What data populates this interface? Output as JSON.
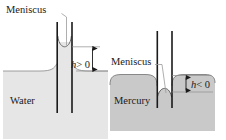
{
  "figure": {
    "width": 226,
    "height": 140,
    "background": "#ffffff"
  },
  "panels": {
    "left": {
      "name": "water-panel",
      "liquid_label": "Water",
      "meniscus_label": "Meniscus",
      "height_label": "h > 0",
      "height_label_symbol": "h",
      "height_label_operator": "> 0",
      "meniscus_shape": "concave",
      "liquid_color": "#e6e6e6",
      "liquid_edge_color": "#808080",
      "tube_wall_color": "#1a1a1a",
      "leader_line_color": "#9a9a9a"
    },
    "right": {
      "name": "mercury-panel",
      "liquid_label": "Mercury",
      "meniscus_label": "Meniscus",
      "height_label": "h < 0",
      "height_label_symbol": "h",
      "height_label_operator": "< 0",
      "meniscus_shape": "convex",
      "liquid_color": "#c9c9c9",
      "liquid_edge_color": "#8a8a8a",
      "tube_wall_color": "#1a1a1a",
      "leader_line_color": "#9a9a9a"
    }
  },
  "annotations": {
    "arrow_color": "#1a1a1a",
    "dimension_line_color": "#808080",
    "text_color": "#1a1a1a"
  }
}
